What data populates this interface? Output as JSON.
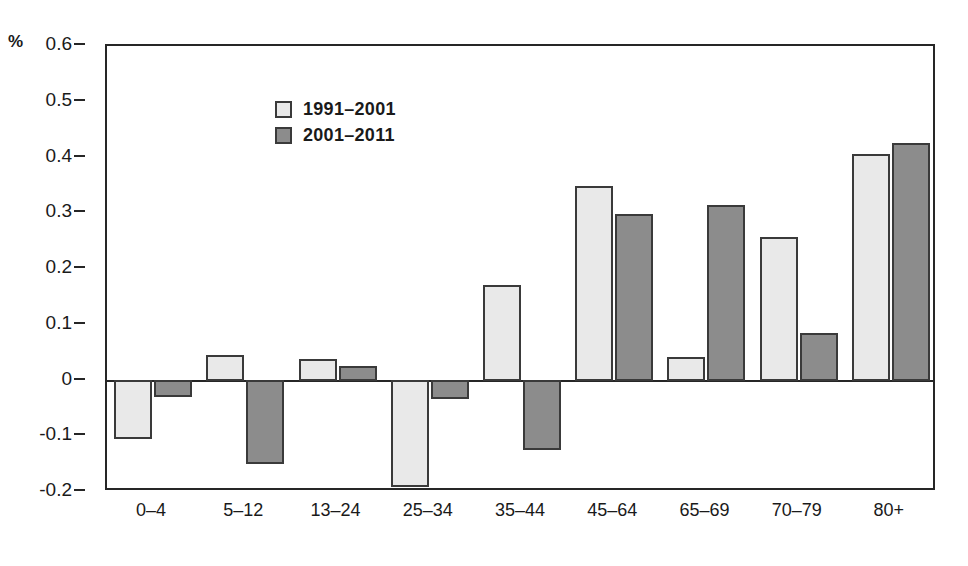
{
  "chart_data": {
    "type": "bar",
    "title": "",
    "xlabel": "",
    "ylabel": "%",
    "unit_label": "%",
    "ylim": [
      -0.2,
      0.6
    ],
    "ytick_step": 0.1,
    "yticks": [
      "0.6",
      "0.5",
      "0.4",
      "0.3",
      "0.2",
      "0.1",
      "0",
      "-0.1",
      "-0.2"
    ],
    "ytick_values": [
      0.6,
      0.5,
      0.4,
      0.3,
      0.2,
      0.1,
      0,
      -0.1,
      -0.2
    ],
    "grid": false,
    "legend_position": "top-left",
    "categories": [
      "0–4",
      "5–12",
      "13–24",
      "25–34",
      "35–44",
      "45–64",
      "65–69",
      "70–79",
      "80+"
    ],
    "series": [
      {
        "name": "1991–2001",
        "color": "#e9e9e9",
        "values": [
          -0.105,
          0.045,
          0.038,
          -0.191,
          0.172,
          0.349,
          0.043,
          0.257,
          0.406
        ]
      },
      {
        "name": "2001–2011",
        "color": "#8c8c8c",
        "values": [
          -0.029,
          -0.149,
          0.026,
          -0.033,
          -0.124,
          0.298,
          0.314,
          0.086,
          0.426
        ]
      }
    ]
  },
  "legend": {
    "items": [
      {
        "label": "1991–2001",
        "swatch": "light"
      },
      {
        "label": "2001–2011",
        "swatch": "dark"
      }
    ]
  }
}
